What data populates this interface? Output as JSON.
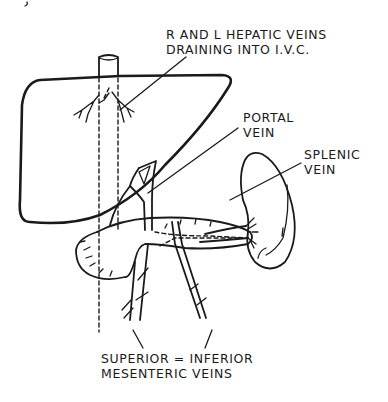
{
  "diagram": {
    "type": "anatomical line drawing",
    "colors": {
      "ink": "#1a1a1a",
      "background": "#ffffff"
    },
    "labels": {
      "hepatic_veins": {
        "line1": "R AND L HEPATIC VEINS",
        "line2": "DRAINING INTO I.V.C."
      },
      "portal_vein": {
        "line1": "PORTAL",
        "line2": "VEIN"
      },
      "splenic_vein": {
        "line1": "SPLENIC",
        "line2": "VEIN"
      },
      "mesenteric_veins": {
        "line1": "SUPERIOR = INFERIOR",
        "line2": "MESENTERIC VEINS"
      }
    },
    "structures": [
      "liver",
      "inferior vena cava",
      "hepatic veins",
      "portal vein",
      "pancreas",
      "spleen",
      "splenic vein",
      "superior mesenteric vein",
      "inferior mesenteric vein"
    ]
  }
}
